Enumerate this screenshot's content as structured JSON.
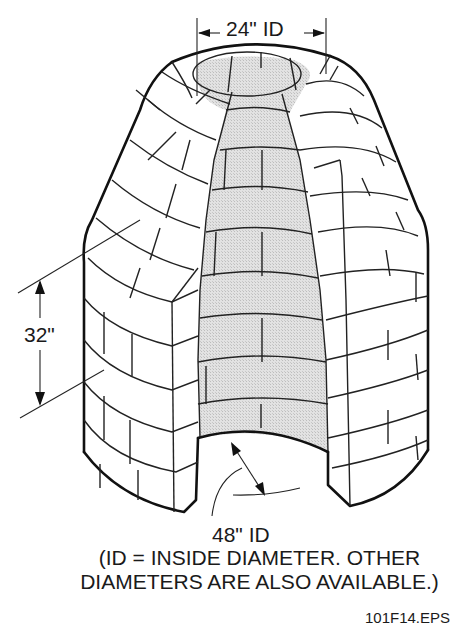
{
  "figure": {
    "type": "isometric technical drawing",
    "colors": {
      "line": "#111111",
      "interior_fill": "#dcdcdc",
      "background": "#ffffff"
    }
  },
  "dimensions": {
    "top_opening": "24\" ID",
    "section_height": "32\"",
    "base_inside_diameter": "48\" ID"
  },
  "note": {
    "line1": "(ID = INSIDE DIAMETER. OTHER",
    "line2": "DIAMETERS ARE ALSO AVAILABLE.)"
  },
  "figure_id": "101F14.EPS"
}
